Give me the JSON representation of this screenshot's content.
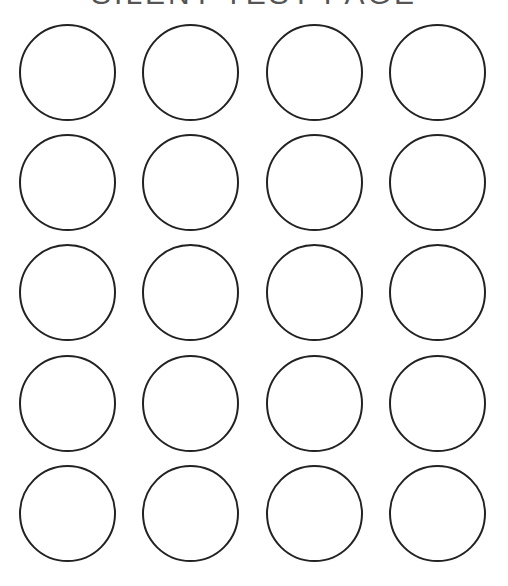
{
  "page": {
    "title": "SILENT TEST PAGE",
    "stroke_color": "#222222",
    "background": "#ffffff"
  },
  "grid": {
    "rows": 5,
    "columns": 4,
    "diameter": 97,
    "column_centers": [
      67,
      190,
      314,
      437
    ],
    "row_centers": [
      72,
      182,
      292,
      403,
      513
    ]
  }
}
